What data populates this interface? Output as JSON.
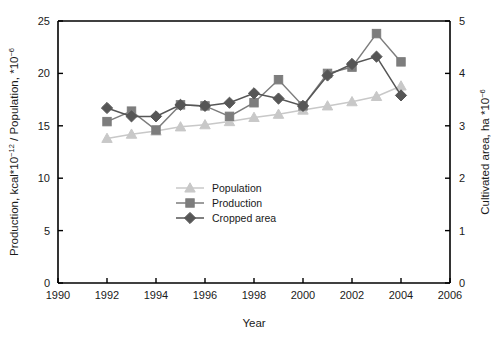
{
  "chart_data": {
    "type": "line",
    "title": "",
    "xlabel": "Year",
    "ylabel": "Production, kcal*10⁻¹² / Population, *10⁻⁶",
    "y2label": "Cultivated area, ha *10⁻⁶",
    "xlim": [
      1990,
      2006
    ],
    "ylim": [
      0,
      25
    ],
    "y2lim": [
      0,
      5
    ],
    "xticks": [
      1990,
      1992,
      1994,
      1996,
      1998,
      2000,
      2002,
      2004,
      2006
    ],
    "yticks": [
      0,
      5,
      10,
      15,
      20,
      25
    ],
    "y2ticks": [
      0,
      1,
      2,
      3,
      4,
      5
    ],
    "grid": false,
    "legend_position": "center",
    "x": [
      1992,
      1993,
      1994,
      1995,
      1996,
      1997,
      1998,
      1999,
      2000,
      2001,
      2002,
      2003,
      2004
    ],
    "series": [
      {
        "name": "Population",
        "marker": "triangle",
        "color": "#c8c8c8",
        "axis": "left",
        "values": [
          13.8,
          14.2,
          14.5,
          14.9,
          15.1,
          15.4,
          15.8,
          16.1,
          16.5,
          16.9,
          17.3,
          17.8,
          18.8
        ]
      },
      {
        "name": "Production",
        "marker": "square",
        "color": "#7d7d7d",
        "axis": "left",
        "values": [
          15.4,
          16.4,
          14.6,
          17.0,
          16.9,
          15.9,
          17.2,
          19.4,
          16.9,
          20.0,
          20.6,
          23.8,
          21.1
        ]
      },
      {
        "name": "Cropped area",
        "marker": "diamond",
        "color": "#565656",
        "axis": "right",
        "values": [
          16.7,
          15.9,
          15.9,
          17.0,
          16.9,
          17.2,
          18.1,
          17.6,
          16.9,
          19.8,
          20.9,
          21.6,
          17.9
        ]
      }
    ]
  },
  "legend": {
    "items": [
      {
        "label": "Population"
      },
      {
        "label": "Production"
      },
      {
        "label": "Cropped area"
      }
    ]
  },
  "axis_labels": {
    "y_left_main": "Production, kcal*10",
    "y_left_sup1": "−12",
    "y_left_mid": " / Population, *10",
    "y_left_sup2": "−6",
    "y_right_main": "Cultivated area, ha *10",
    "y_right_sup": "−6",
    "x_title": "Year"
  }
}
